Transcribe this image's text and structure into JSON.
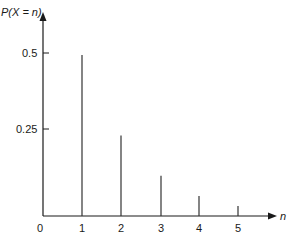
{
  "chart_data": {
    "type": "bar",
    "subtype": "stem",
    "title": "",
    "xlabel": "n",
    "ylabel": "P(X = n)",
    "categories": [
      "1",
      "2",
      "3",
      "4",
      "5"
    ],
    "x": [
      1,
      2,
      3,
      4,
      5
    ],
    "values": [
      0.5,
      0.25,
      0.125,
      0.0625,
      0.03125
    ],
    "x_ticks": [
      "0",
      "1",
      "2",
      "3",
      "4",
      "5"
    ],
    "y_ticks": [
      "0.25",
      "0.5"
    ],
    "y_tick_values": [
      0.25,
      0.5
    ],
    "ylim": [
      0,
      0.6
    ],
    "xlim": [
      0,
      6
    ],
    "grid": false,
    "legend": null,
    "color": "#1a1a1a"
  },
  "labels": {
    "ylabel": "P(X = n)",
    "xlabel": "n",
    "origin": "0",
    "ytick_05": "0.5",
    "ytick_025": "0.25",
    "xtick_1": "1",
    "xtick_2": "2",
    "xtick_3": "3",
    "xtick_4": "4",
    "xtick_5": "5"
  }
}
